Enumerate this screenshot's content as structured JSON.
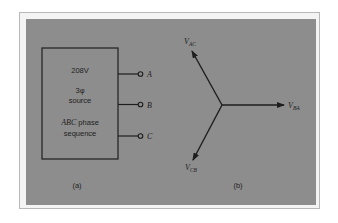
{
  "figure": {
    "part_a": {
      "caption": "(a)",
      "box_lines": [
        "208V",
        "3φ",
        "source",
        "ABC phase",
        "sequence"
      ],
      "abc_italic": "ABC",
      "phase_word": " phase",
      "terminals": [
        {
          "label": "A"
        },
        {
          "label": "B"
        },
        {
          "label": "C"
        }
      ]
    },
    "part_b": {
      "caption": "(b)",
      "phasors": [
        {
          "name": "V",
          "sub": "AC",
          "direction": "up-left"
        },
        {
          "name": "V",
          "sub": "BA",
          "direction": "right"
        },
        {
          "name": "V",
          "sub": "CB",
          "direction": "down-left"
        }
      ]
    },
    "colors": {
      "background": "#ffffff",
      "panel": "#8d8d8d",
      "ink": "#1e1e1e",
      "frame": "#b8b8b8"
    }
  }
}
